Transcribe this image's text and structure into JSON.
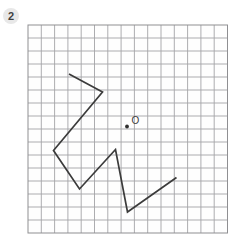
{
  "exercise": {
    "number": "2"
  },
  "badge": {
    "background": "#e8e8e8",
    "text_color": "#414141"
  },
  "grid": {
    "left": 28,
    "top": 25,
    "cols": 15,
    "rows": 16,
    "cell_w": 13.3,
    "cell_h": 13.0,
    "line_color": "#a4a4a7",
    "border_color": "#8f8f92",
    "background": "#fefefe"
  },
  "figure": {
    "stroke": "#3b3b3b",
    "stroke_width": 1.7,
    "polyline": [
      [
        69,
        74
      ],
      [
        102.5,
        92
      ],
      [
        53.5,
        150.5
      ],
      [
        79.5,
        189
      ],
      [
        115.5,
        149.5
      ],
      [
        127.5,
        212
      ],
      [
        176.5,
        177.5
      ]
    ]
  },
  "center_point": {
    "label": "O",
    "label_color": "#3b3b3b",
    "label_pos": {
      "x": 131.5,
      "y": 124
    },
    "dot": {
      "x": 127,
      "y": 126.5,
      "radius": 1.9,
      "color": "#2f2f2f"
    }
  }
}
